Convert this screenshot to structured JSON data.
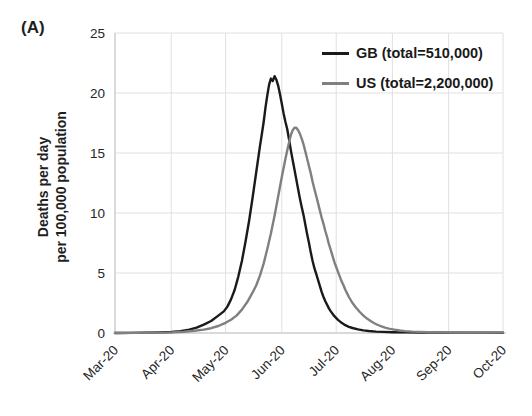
{
  "panel_label": "(A)",
  "colors": {
    "grid": "#e0e0e0",
    "axis": "#c4c4c4",
    "text": "#262626",
    "gb_line": "#1a1a1a",
    "us_line": "#808080",
    "background": "#ffffff"
  },
  "chart_data": {
    "type": "line",
    "title": "",
    "xlabel": "",
    "ylabel": "Deaths per day per 100,000 population",
    "ylabel_lines": [
      "Deaths per day",
      "per 100,000 population"
    ],
    "ylim": [
      0,
      25
    ],
    "yticks": [
      0,
      5,
      10,
      15,
      20,
      25
    ],
    "grid": true,
    "legend_position": "top-right-inside",
    "x_axis": {
      "unit": "days since 2020-03-01",
      "range": [
        0,
        214
      ],
      "tick_days": [
        0,
        31,
        61,
        92,
        122,
        153,
        184,
        214
      ],
      "tick_labels": [
        "Mar-20",
        "Apr-20",
        "May-20",
        "Jun-20",
        "Jul-20",
        "Aug-20",
        "Sep-20",
        "Oct-20"
      ]
    },
    "series": [
      {
        "name": "GB",
        "legend_label": "GB (total=510,000)",
        "color": "#1a1a1a",
        "points": [
          [
            0,
            0
          ],
          [
            8,
            0.01
          ],
          [
            16,
            0.03
          ],
          [
            24,
            0.05
          ],
          [
            31,
            0.08
          ],
          [
            36,
            0.15
          ],
          [
            41,
            0.28
          ],
          [
            45,
            0.45
          ],
          [
            49,
            0.7
          ],
          [
            53,
            1.0
          ],
          [
            57,
            1.45
          ],
          [
            60,
            1.8
          ],
          [
            62,
            2.2
          ],
          [
            64,
            2.8
          ],
          [
            66,
            3.6
          ],
          [
            68,
            4.7
          ],
          [
            70,
            6.0
          ],
          [
            72,
            7.6
          ],
          [
            74,
            9.4
          ],
          [
            76,
            11.4
          ],
          [
            78,
            13.5
          ],
          [
            80,
            15.6
          ],
          [
            81,
            16.6
          ],
          [
            82,
            17.6
          ],
          [
            83,
            18.8
          ],
          [
            84,
            19.8
          ],
          [
            85,
            20.7
          ],
          [
            86,
            21.2
          ],
          [
            87,
            21.0
          ],
          [
            88,
            21.4
          ],
          [
            89,
            21.1
          ],
          [
            90,
            20.6
          ],
          [
            91,
            19.9
          ],
          [
            92,
            19.1
          ],
          [
            93,
            18.3
          ],
          [
            94,
            17.6
          ],
          [
            95,
            17.0
          ],
          [
            96,
            16.1
          ],
          [
            97,
            15.2
          ],
          [
            98,
            14.4
          ],
          [
            99,
            13.6
          ],
          [
            100,
            12.8
          ],
          [
            101,
            12.0
          ],
          [
            102,
            11.2
          ],
          [
            103,
            10.5
          ],
          [
            104,
            9.8
          ],
          [
            105,
            9.0
          ],
          [
            106,
            8.2
          ],
          [
            107,
            7.5
          ],
          [
            108,
            6.7
          ],
          [
            109,
            6.0
          ],
          [
            110,
            5.4
          ],
          [
            111,
            4.9
          ],
          [
            112,
            4.4
          ],
          [
            113,
            3.9
          ],
          [
            114,
            3.4
          ],
          [
            115,
            3.0
          ],
          [
            116,
            2.65
          ],
          [
            117,
            2.35
          ],
          [
            118,
            2.05
          ],
          [
            119,
            1.8
          ],
          [
            121,
            1.4
          ],
          [
            123,
            1.1
          ],
          [
            125,
            0.85
          ],
          [
            127,
            0.65
          ],
          [
            129,
            0.52
          ],
          [
            131,
            0.42
          ],
          [
            134,
            0.3
          ],
          [
            137,
            0.22
          ],
          [
            140,
            0.17
          ],
          [
            144,
            0.12
          ],
          [
            148,
            0.09
          ],
          [
            153,
            0.07
          ],
          [
            160,
            0.05
          ],
          [
            170,
            0.04
          ],
          [
            184,
            0.03
          ],
          [
            200,
            0.03
          ],
          [
            214,
            0.02
          ]
        ]
      },
      {
        "name": "US",
        "legend_label": "US (total=2,200,000)",
        "color": "#808080",
        "points": [
          [
            0,
            0
          ],
          [
            12,
            0.01
          ],
          [
            22,
            0.03
          ],
          [
            31,
            0.05
          ],
          [
            38,
            0.1
          ],
          [
            44,
            0.18
          ],
          [
            49,
            0.28
          ],
          [
            53,
            0.4
          ],
          [
            57,
            0.58
          ],
          [
            61,
            0.85
          ],
          [
            64,
            1.1
          ],
          [
            67,
            1.45
          ],
          [
            70,
            1.95
          ],
          [
            73,
            2.6
          ],
          [
            76,
            3.4
          ],
          [
            78,
            4.0
          ],
          [
            80,
            4.8
          ],
          [
            82,
            5.8
          ],
          [
            84,
            7.0
          ],
          [
            86,
            8.3
          ],
          [
            88,
            9.8
          ],
          [
            90,
            11.4
          ],
          [
            92,
            13.0
          ],
          [
            94,
            14.5
          ],
          [
            95,
            15.2
          ],
          [
            96,
            15.9
          ],
          [
            97,
            16.5
          ],
          [
            98,
            16.9
          ],
          [
            99,
            17.1
          ],
          [
            100,
            17.1
          ],
          [
            101,
            16.9
          ],
          [
            102,
            16.6
          ],
          [
            103,
            16.2
          ],
          [
            104,
            15.7
          ],
          [
            105,
            15.1
          ],
          [
            106,
            14.5
          ],
          [
            107,
            13.9
          ],
          [
            108,
            13.3
          ],
          [
            109,
            12.6
          ],
          [
            110,
            12.0
          ],
          [
            111,
            11.4
          ],
          [
            112,
            10.8
          ],
          [
            113,
            10.2
          ],
          [
            114,
            9.6
          ],
          [
            115,
            9.1
          ],
          [
            116,
            8.5
          ],
          [
            117,
            8.0
          ],
          [
            118,
            7.4
          ],
          [
            119,
            6.9
          ],
          [
            120,
            6.4
          ],
          [
            121,
            5.9
          ],
          [
            122,
            5.5
          ],
          [
            123,
            5.1
          ],
          [
            124,
            4.7
          ],
          [
            125,
            4.3
          ],
          [
            126,
            4.0
          ],
          [
            127,
            3.6
          ],
          [
            128,
            3.3
          ],
          [
            129,
            3.0
          ],
          [
            131,
            2.5
          ],
          [
            133,
            2.1
          ],
          [
            135,
            1.75
          ],
          [
            137,
            1.45
          ],
          [
            139,
            1.2
          ],
          [
            141,
            1.0
          ],
          [
            143,
            0.82
          ],
          [
            145,
            0.67
          ],
          [
            147,
            0.55
          ],
          [
            149,
            0.45
          ],
          [
            151,
            0.37
          ],
          [
            154,
            0.28
          ],
          [
            157,
            0.21
          ],
          [
            160,
            0.16
          ],
          [
            164,
            0.12
          ],
          [
            168,
            0.09
          ],
          [
            173,
            0.07
          ],
          [
            180,
            0.05
          ],
          [
            188,
            0.04
          ],
          [
            198,
            0.03
          ],
          [
            214,
            0.03
          ]
        ]
      }
    ]
  }
}
